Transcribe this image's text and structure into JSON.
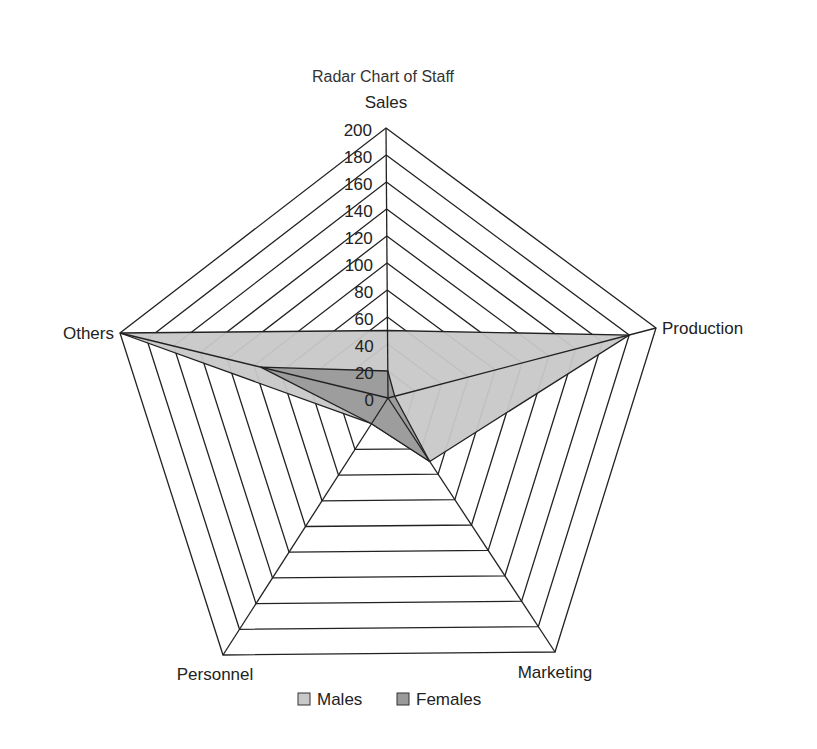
{
  "chart_data": {
    "type": "radar",
    "title": "Radar Chart of Staff",
    "categories": [
      "Sales",
      "Production",
      "Marketing",
      "Personnel",
      "Others"
    ],
    "series": [
      {
        "name": "Males",
        "values": [
          50,
          180,
          50,
          20,
          200
        ],
        "color": "#c8c8c8"
      },
      {
        "name": "Females",
        "values": [
          20,
          5,
          50,
          20,
          95
        ],
        "color": "#9a9a9a"
      }
    ],
    "rmin": 0,
    "rmax": 200,
    "ticks": [
      0,
      20,
      40,
      60,
      80,
      100,
      120,
      140,
      160,
      180,
      200
    ],
    "tick_labels": [
      "0",
      "20",
      "40",
      "60",
      "80",
      "100",
      "120",
      "140",
      "160",
      "180",
      "200"
    ],
    "grid": true,
    "legend_position": "bottom"
  },
  "legend": {
    "items": [
      {
        "label": "Males",
        "color": "#c8c8c8"
      },
      {
        "label": "Females",
        "color": "#9a9a9a"
      }
    ]
  }
}
